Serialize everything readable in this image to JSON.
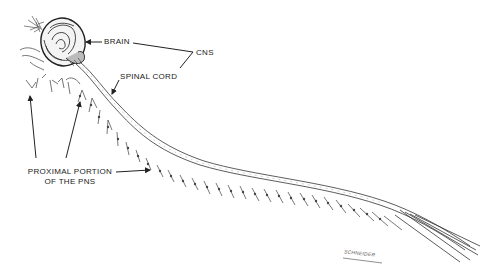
{
  "diagram": {
    "labels": {
      "brain": "BRAIN",
      "cns": "CNS",
      "spinal_cord": "SPINAL CORD",
      "pns_line1": "PROXIMAL PORTION",
      "pns_line2": "OF THE PNS"
    },
    "signature": "SCHNEIDER",
    "colors": {
      "ink": "#222222",
      "background": "#ffffff",
      "shading": "#888888"
    }
  }
}
